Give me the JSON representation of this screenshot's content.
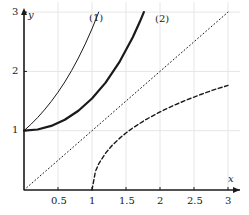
{
  "chart_data": {
    "type": "line",
    "title": "",
    "xlabel": "x",
    "ylabel": "y",
    "xlim": [
      0,
      3
    ],
    "ylim": [
      0,
      3
    ],
    "xticks": [
      0.5,
      1,
      1.5,
      2,
      2.5,
      3
    ],
    "xticklabels": [
      "0.5",
      "1",
      "1.5",
      "2",
      "2.5",
      "3"
    ],
    "yticks": [
      1,
      2,
      3
    ],
    "yticklabels": [
      "1",
      "2",
      "3"
    ],
    "grid": true,
    "grid_color": "#e6e6e6",
    "axis_color": "#1a1a1a",
    "legend_position": "inside-top",
    "annotations": [
      {
        "text": "(1)",
        "x": 1.0,
        "y": 2.82
      },
      {
        "text": "(2)",
        "x": 2.0,
        "y": 2.78
      }
    ],
    "series": [
      {
        "name": "(1)",
        "style": "solid-thin",
        "color": "#1a1a1a",
        "linewidth": 1.0,
        "points": [
          [
            0.0,
            1.0
          ],
          [
            0.1,
            1.105
          ],
          [
            0.2,
            1.221
          ],
          [
            0.3,
            1.35
          ],
          [
            0.4,
            1.492
          ],
          [
            0.5,
            1.649
          ],
          [
            0.6,
            1.822
          ],
          [
            0.7,
            2.014
          ],
          [
            0.8,
            2.226
          ],
          [
            0.9,
            2.46
          ],
          [
            1.0,
            2.718
          ],
          [
            1.05,
            2.858
          ],
          [
            1.0986,
            3.0
          ]
        ]
      },
      {
        "name": "(2)",
        "style": "solid-thick",
        "color": "#1a1a1a",
        "linewidth": 2.2,
        "points": [
          [
            0.0,
            1.0
          ],
          [
            0.2,
            1.02
          ],
          [
            0.4,
            1.081
          ],
          [
            0.6,
            1.185
          ],
          [
            0.8,
            1.337
          ],
          [
            1.0,
            1.543
          ],
          [
            1.2,
            1.811
          ],
          [
            1.4,
            2.151
          ],
          [
            1.6,
            2.577
          ],
          [
            1.7,
            2.828
          ],
          [
            1.7627,
            3.0
          ]
        ]
      },
      {
        "name": "y = x",
        "style": "dotted",
        "color": "#1a1a1a",
        "linewidth": 1.0,
        "points": [
          [
            0.0,
            0.0
          ],
          [
            3.0,
            3.0
          ]
        ]
      },
      {
        "name": "dashed",
        "style": "dashed",
        "color": "#1a1a1a",
        "linewidth": 1.4,
        "points": [
          [
            1.0,
            0.0
          ],
          [
            1.05,
            0.312
          ],
          [
            1.1,
            0.444
          ],
          [
            1.2,
            0.622
          ],
          [
            1.3,
            0.757
          ],
          [
            1.4,
            0.867
          ],
          [
            1.5,
            0.962
          ],
          [
            1.6,
            1.047
          ],
          [
            1.8,
            1.193
          ],
          [
            2.0,
            1.317
          ],
          [
            2.2,
            1.426
          ],
          [
            2.4,
            1.523
          ],
          [
            2.6,
            1.611
          ],
          [
            2.8,
            1.693
          ],
          [
            3.0,
            1.763
          ]
        ]
      }
    ]
  },
  "axes": {
    "x_axis_name": "x",
    "y_axis_name": "y",
    "x_tick_labels": [
      "0.5",
      "1",
      "1.5",
      "2",
      "2.5",
      "3"
    ],
    "y_tick_labels": [
      "1",
      "2",
      "3"
    ],
    "curve_label_1": "(1)",
    "curve_label_2": "(2)"
  }
}
